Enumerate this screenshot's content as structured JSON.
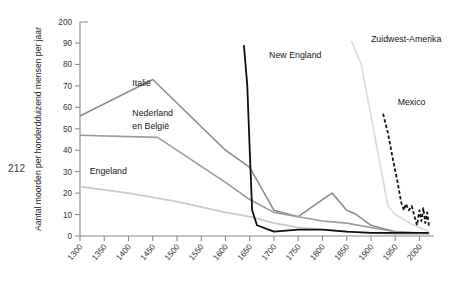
{
  "page": {
    "number": "212"
  },
  "chart_data": {
    "type": "line",
    "title": "",
    "subtitle": "",
    "xlabel": "",
    "ylabel": "Aantal moorden per honderdduizend mensen per jaar",
    "grid": false,
    "legend_position": "inline-labels",
    "x_tick_labels": [
      "1300",
      "1350",
      "1400",
      "1450",
      "1500",
      "1550",
      "1600",
      "1650",
      "1700",
      "1750",
      "1800",
      "1850",
      "1900",
      "1950",
      "2000"
    ],
    "y_tick_labels": [
      "0",
      "10",
      "20",
      "30",
      "40",
      "50",
      "60",
      "70",
      "80",
      "90",
      "200"
    ],
    "xlim": [
      1300,
      2030
    ],
    "ylim": [
      0,
      100
    ],
    "y_axis_note": "As is gebroken tussen 90 en 200",
    "series": [
      {
        "name": "Italië",
        "color": "#8c8c8c",
        "style": "solid",
        "width": 1.6,
        "label_x": 1408,
        "label_y": 70,
        "points": [
          [
            1300,
            56
          ],
          [
            1450,
            73
          ],
          [
            1600,
            40
          ],
          [
            1650,
            32
          ],
          [
            1700,
            12
          ],
          [
            1750,
            9
          ],
          [
            1800,
            17
          ],
          [
            1820,
            20
          ],
          [
            1850,
            12
          ],
          [
            1870,
            10
          ],
          [
            1900,
            5
          ],
          [
            1950,
            2
          ],
          [
            2000,
            1.5
          ],
          [
            2020,
            1.3
          ]
        ]
      },
      {
        "name": "Nederland en België",
        "color": "#9a9a9a",
        "style": "solid",
        "width": 1.6,
        "label_x": 1408,
        "label_y": 56,
        "label_line2_y": 50,
        "points": [
          [
            1300,
            47
          ],
          [
            1460,
            46
          ],
          [
            1600,
            25
          ],
          [
            1650,
            17
          ],
          [
            1700,
            11
          ],
          [
            1750,
            9
          ],
          [
            1800,
            7
          ],
          [
            1850,
            6
          ],
          [
            1900,
            4
          ],
          [
            1950,
            2
          ],
          [
            2000,
            1.2
          ],
          [
            2020,
            1.1
          ]
        ]
      },
      {
        "name": "Engeland",
        "color": "#c9c9c9",
        "style": "solid",
        "width": 1.8,
        "label_x": 1320,
        "label_y": 29,
        "points": [
          [
            1300,
            23
          ],
          [
            1400,
            20
          ],
          [
            1500,
            16
          ],
          [
            1600,
            11
          ],
          [
            1650,
            9
          ],
          [
            1700,
            6
          ],
          [
            1750,
            4
          ],
          [
            1800,
            3
          ],
          [
            1850,
            2
          ],
          [
            1900,
            1.5
          ],
          [
            1950,
            1
          ],
          [
            2000,
            1
          ],
          [
            2020,
            1
          ]
        ]
      },
      {
        "name": "New England",
        "color": "#101010",
        "style": "solid",
        "width": 1.8,
        "label_x": 1690,
        "label_y": 83,
        "points": [
          [
            1638,
            89
          ],
          [
            1645,
            70
          ],
          [
            1650,
            40
          ],
          [
            1655,
            12
          ],
          [
            1665,
            5
          ],
          [
            1700,
            2
          ],
          [
            1750,
            3
          ],
          [
            1800,
            3
          ],
          [
            1850,
            2
          ],
          [
            1900,
            1.5
          ],
          [
            1950,
            1.5
          ],
          [
            2000,
            1.5
          ],
          [
            2020,
            1.5
          ]
        ]
      },
      {
        "name": "Zuidwest-Amerika",
        "color": "#dcdcdc",
        "style": "solid",
        "width": 1.8,
        "label_x": 1900,
        "label_y": 93,
        "points": [
          [
            1860,
            100
          ],
          [
            1880,
            80
          ],
          [
            1900,
            56
          ],
          [
            1920,
            32
          ],
          [
            1935,
            14
          ],
          [
            1950,
            10
          ],
          [
            1965,
            8
          ],
          [
            1980,
            6
          ],
          [
            2000,
            4
          ],
          [
            2020,
            2
          ]
        ]
      },
      {
        "name": "Mexico",
        "color": "#151515",
        "style": "dashed",
        "width": 1.8,
        "label_x": 1955,
        "label_y": 61,
        "points": [
          [
            1925,
            57
          ],
          [
            1935,
            48
          ],
          [
            1945,
            36
          ],
          [
            1955,
            25
          ],
          [
            1962,
            16
          ],
          [
            1968,
            12
          ],
          [
            1972,
            15
          ],
          [
            1978,
            12
          ],
          [
            1984,
            14
          ],
          [
            1990,
            9
          ],
          [
            1995,
            5
          ],
          [
            2000,
            12
          ],
          [
            2004,
            7
          ],
          [
            2008,
            13
          ],
          [
            2012,
            6
          ],
          [
            2016,
            11
          ],
          [
            2020,
            4
          ]
        ]
      }
    ]
  }
}
